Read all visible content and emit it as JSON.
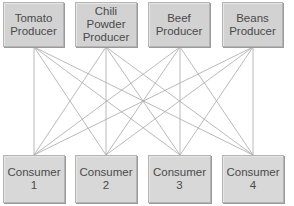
{
  "diagram": {
    "type": "bipartite-network",
    "producers": [
      {
        "label": "Tomato\nProducer",
        "x": 3,
        "w": 61,
        "cx": 34
      },
      {
        "label": "Chili\nPowder\nProducer",
        "x": 75,
        "w": 62,
        "cx": 106
      },
      {
        "label": "Beef\nProducer",
        "x": 148,
        "w": 62,
        "cx": 180
      },
      {
        "label": "Beans\nProducer",
        "x": 222,
        "w": 61,
        "cx": 253
      }
    ],
    "consumers": [
      {
        "label": "Consumer\n1",
        "x": 3,
        "w": 62,
        "cx": 34
      },
      {
        "label": "Consumer\n2",
        "x": 75,
        "w": 62,
        "cx": 106
      },
      {
        "label": "Consumer\n3",
        "x": 148,
        "w": 63,
        "cx": 180
      },
      {
        "label": "Consumer\n4",
        "x": 222,
        "w": 62,
        "cx": 253
      }
    ],
    "connections": "every producer connects to every consumer",
    "link_y_top": 47,
    "link_y_bottom": 155,
    "colors": {
      "box_fill": "#d2d2d2",
      "box_border": "#b4b4b4",
      "text": "#4a4a4a",
      "link": "#a8a8a8"
    }
  }
}
